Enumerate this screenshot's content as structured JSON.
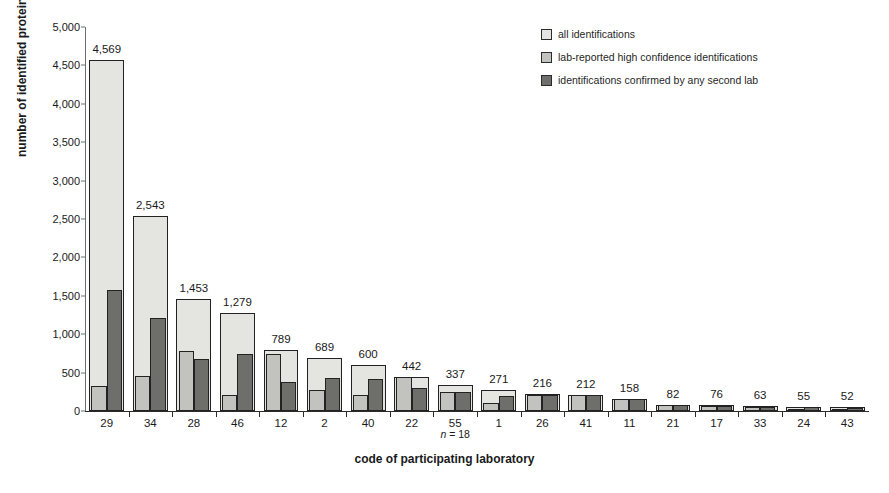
{
  "chart_data": {
    "type": "bar",
    "title": "",
    "xlabel": "code of participating laboratory",
    "ylabel": "number of identified proteins",
    "annotation": "n = 18",
    "ylim": [
      0,
      5000
    ],
    "ytick_labels": [
      "0",
      "500",
      "1,000",
      "1,500",
      "2,000",
      "2,500",
      "3,000",
      "3,500",
      "4,000",
      "4,500",
      "5,000"
    ],
    "ytick_values": [
      0,
      500,
      1000,
      1500,
      2000,
      2500,
      3000,
      3500,
      4000,
      4500,
      5000
    ],
    "grid": false,
    "legend_position": "top-right",
    "categories": [
      "29",
      "34",
      "28",
      "46",
      "12",
      "2",
      "40",
      "22",
      "55",
      "1",
      "26",
      "41",
      "11",
      "21",
      "17",
      "33",
      "24",
      "43"
    ],
    "series": [
      {
        "name": "all identifications",
        "color": "#e4e4e1",
        "values": [
          4569,
          2543,
          1453,
          1279,
          789,
          689,
          600,
          442,
          337,
          271,
          216,
          212,
          158,
          82,
          76,
          63,
          55,
          52
        ],
        "labels": [
          "4,569",
          "2,543",
          "1,453",
          "1,279",
          "789",
          "689",
          "600",
          "442",
          "337",
          "271",
          "216",
          "212",
          "158",
          "82",
          "76",
          "63",
          "55",
          "52"
        ]
      },
      {
        "name": "lab-reported high confidence identifications",
        "color": "#c2c2bf",
        "values": [
          320,
          452,
          775,
          215,
          745,
          270,
          205,
          440,
          245,
          100,
          205,
          205,
          150,
          78,
          70,
          58,
          30,
          28
        ]
      },
      {
        "name": "identifications confirmed by any second lab",
        "color": "#6e6e6b",
        "values": [
          1580,
          1208,
          675,
          748,
          375,
          430,
          420,
          295,
          245,
          195,
          205,
          205,
          155,
          72,
          70,
          58,
          50,
          45
        ]
      }
    ]
  },
  "legend": {
    "items": [
      {
        "label": "all identifications",
        "color": "#e4e4e1"
      },
      {
        "label": "lab-reported high confidence identifications",
        "color": "#c2c2bf"
      },
      {
        "label": "identifications confirmed by any second lab",
        "color": "#6e6e6b"
      }
    ]
  }
}
